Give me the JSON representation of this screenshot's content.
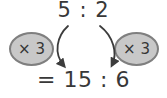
{
  "diagram": {
    "original_ratio": "5 : 2",
    "left_multiplier": "× 3",
    "right_multiplier": "× 3",
    "result": "= 15 : 6",
    "colors": {
      "background": "#ffffff",
      "oval_fill": "#c8c8c8",
      "oval_border": "#7f7f7f",
      "arrow": "#3c3c3c",
      "text": "#383838"
    }
  }
}
